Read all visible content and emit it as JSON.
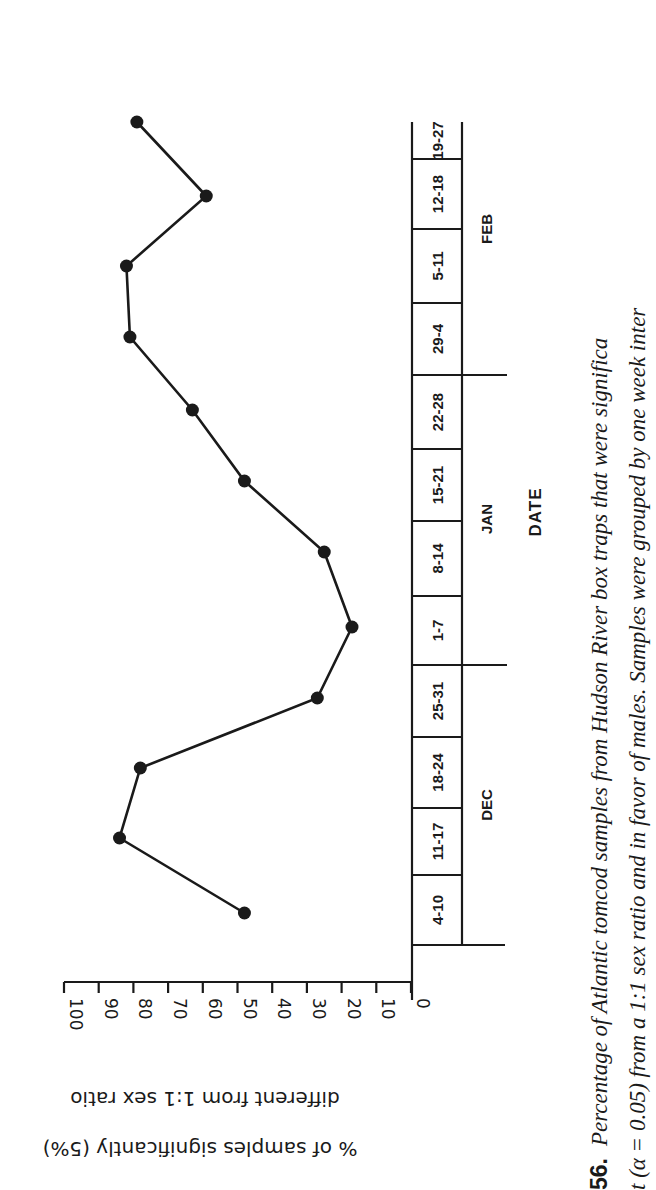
{
  "chart_data": {
    "type": "line",
    "orientation": "rotated-90-clockwise",
    "title": "",
    "xlabel": "DATE",
    "ylabel": "% of samples significantly (5%) different from 1:1 sex ratio",
    "ylabel_lines": [
      "% of samples significantly (5%)",
      "different from 1:1 sex ratio"
    ],
    "ylim": [
      0,
      100
    ],
    "yticks": [
      0,
      10,
      20,
      30,
      40,
      50,
      60,
      70,
      80,
      90,
      100
    ],
    "grid": false,
    "legend": null,
    "months": [
      {
        "label": "DEC",
        "span": [
          "4-10",
          "25-31"
        ]
      },
      {
        "label": "JAN",
        "span": [
          "1-7",
          "22-28"
        ]
      },
      {
        "label": "FEB",
        "span": [
          "29-4",
          "19-27"
        ]
      }
    ],
    "categories": [
      "4-10",
      "11-17",
      "18-24",
      "25-31",
      "1-7",
      "8-14",
      "15-21",
      "22-28",
      "29-4",
      "5-11",
      "12-18",
      "19-27"
    ],
    "series": [
      {
        "name": "Percent significantly different (favor of males)",
        "values": [
          48,
          84,
          78,
          27,
          17,
          25,
          48,
          63,
          81,
          82,
          59,
          79
        ],
        "marker": "filled-circle"
      }
    ]
  },
  "caption": {
    "number": "56.",
    "line1": "Percentage of Atlantic tomcod samples from Hudson River box traps that were significa",
    "line2": "t (α = 0.05) from a 1:1 sex ratio and in favor of males. Samples were grouped by one week inter"
  },
  "axis_text": {
    "ytick_labels": [
      "0",
      "10",
      "20",
      "30",
      "40",
      "50",
      "60",
      "70",
      "80",
      "90",
      "100"
    ],
    "xlabel": "DATE",
    "ylabel_line1": "% of samples significantly (5%)",
    "ylabel_line2": "different from 1:1 sex ratio",
    "months": [
      "DEC",
      "JAN",
      "FEB"
    ],
    "cells": [
      "4-10",
      "11-17",
      "18-24",
      "25-31",
      "1-7",
      "8-14",
      "15-21",
      "22-28",
      "29-4",
      "5-11",
      "12-18",
      "19-27"
    ]
  },
  "colors": {
    "ink": "#1a1a1a",
    "background": "#ffffff"
  }
}
